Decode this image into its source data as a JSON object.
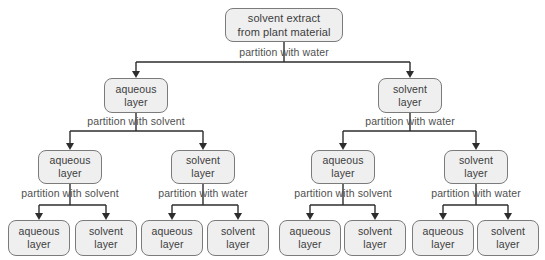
{
  "diagram": {
    "type": "flowchart-tree",
    "colors": {
      "background": "#ffffff",
      "box_fill": "#efefef",
      "box_border": "#7b7b7b",
      "box_text": "#3c3c3c",
      "edge_label_text": "#4f4f4f",
      "line": "#2d2d2d"
    }
  },
  "nodes": {
    "root": "solvent extract\nfrom plant material",
    "l2_left": "aqueous\nlayer",
    "l2_right": "solvent\nlayer",
    "l3_1": "aqueous\nlayer",
    "l3_2": "solvent\nlayer",
    "l3_3": "aqueous\nlayer",
    "l3_4": "solvent\nlayer",
    "leaf_1": "aqueous\nlayer",
    "leaf_2": "solvent\nlayer",
    "leaf_3": "aqueous\nlayer",
    "leaf_4": "solvent\nlayer",
    "leaf_5": "aqueous\nlayer",
    "leaf_6": "solvent\nlayer",
    "leaf_7": "aqueous\nlayer",
    "leaf_8": "solvent\nlayer"
  },
  "edge_labels": {
    "root": "partition with water",
    "l2_left": "partition with solvent",
    "l2_right": "partition with water",
    "l3_1": "partition with solvent",
    "l3_2": "partition with water",
    "l3_3": "partition with solvent",
    "l3_4": "partition with water"
  }
}
